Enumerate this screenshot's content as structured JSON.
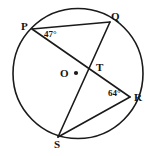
{
  "figure": {
    "kind": "circle-geometry-diagram",
    "background_color": "#ffffff",
    "stroke_color": "#1a1a1a",
    "label_color": "#151515",
    "circle": {
      "name": "circle-O",
      "center_label": "O",
      "center_x": 78,
      "center_y": 73.5,
      "radius": 65,
      "center_dot_radius": 2.1,
      "stroke_width": 1.6
    },
    "points": [
      {
        "id": "P",
        "label": "P",
        "x": 32,
        "y": 29,
        "on_circle": true
      },
      {
        "id": "Q",
        "label": "Q",
        "x": 110,
        "y": 22,
        "on_circle": true
      },
      {
        "id": "R",
        "label": "R",
        "x": 130,
        "y": 97,
        "on_circle": true
      },
      {
        "id": "S",
        "label": "S",
        "x": 58,
        "y": 137,
        "on_circle": true
      },
      {
        "id": "T",
        "label": "T",
        "x": 90,
        "y": 68,
        "on_circle": false
      }
    ],
    "segments": [
      {
        "id": "PQ",
        "label": "chord-PQ",
        "x1": 32,
        "y1": 29,
        "x2": 110,
        "y2": 22
      },
      {
        "id": "PR",
        "label": "chord-PR",
        "x1": 32,
        "y1": 29,
        "x2": 130,
        "y2": 97
      },
      {
        "id": "QS",
        "label": "chord-QS",
        "x1": 110,
        "y1": 22,
        "x2": 58,
        "y2": 137
      },
      {
        "id": "SR",
        "label": "chord-SR",
        "x1": 58,
        "y1": 137,
        "x2": 130,
        "y2": 97
      }
    ],
    "angles": [
      {
        "id": "angle-at-P",
        "vertex": "P",
        "value": "47°",
        "arms": [
          "PQ",
          "PR"
        ]
      },
      {
        "id": "angle-at-R",
        "vertex": "R",
        "value": "64°",
        "arms": [
          "RS",
          "RP"
        ]
      }
    ],
    "intersection": {
      "id": "T",
      "label": "T",
      "description": "intersection of chords PR and QS"
    }
  }
}
